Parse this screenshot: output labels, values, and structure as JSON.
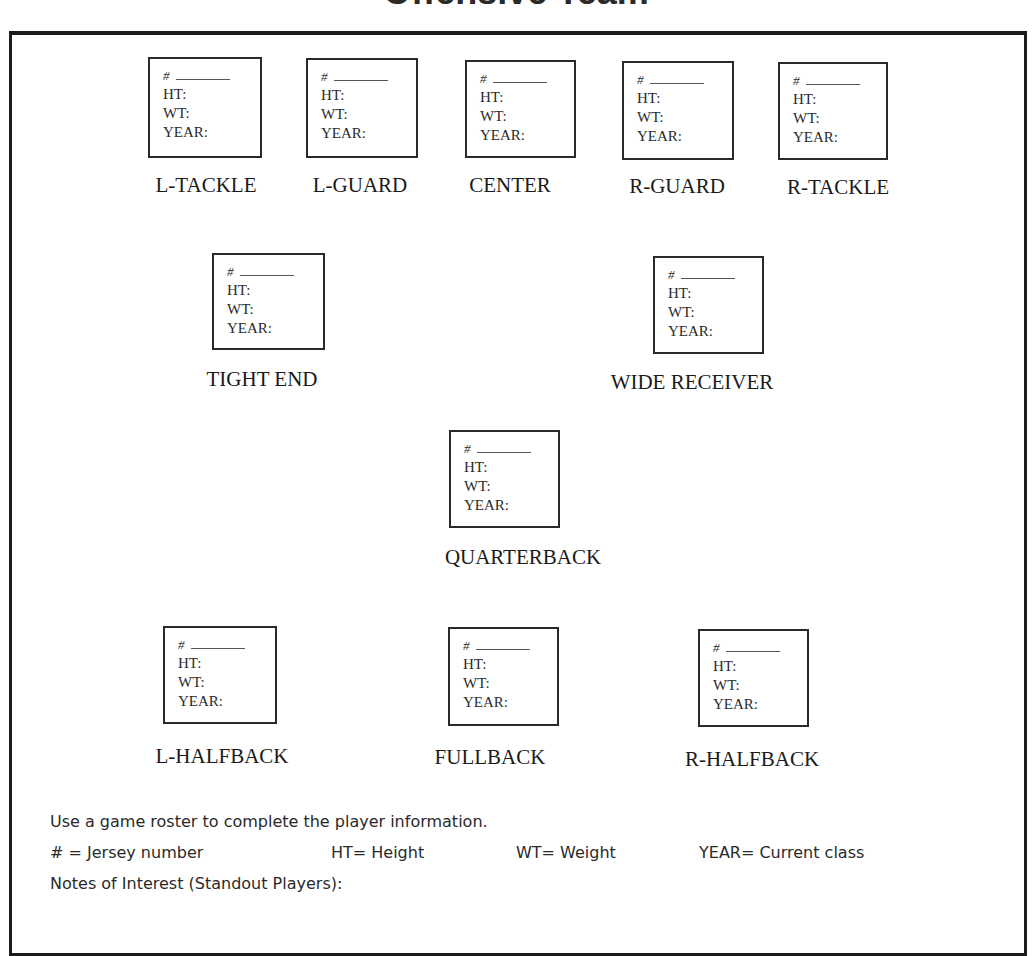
{
  "page": {
    "title": "Offensive Team"
  },
  "field_labels": {
    "jersey": "#",
    "height": "HT:",
    "weight": "WT:",
    "year": "YEAR:"
  },
  "positions": [
    {
      "id": "l-tackle",
      "label": "L-TACKLE",
      "box": {
        "x": 148,
        "y": 57,
        "w": 114,
        "h": 101
      },
      "label_pos": {
        "cx": 206,
        "y": 173
      }
    },
    {
      "id": "l-guard",
      "label": "L-GUARD",
      "box": {
        "x": 306,
        "y": 58,
        "w": 112,
        "h": 100
      },
      "label_pos": {
        "cx": 360,
        "y": 173
      }
    },
    {
      "id": "center",
      "label": "CENTER",
      "box": {
        "x": 465,
        "y": 60,
        "w": 111,
        "h": 98
      },
      "label_pos": {
        "cx": 510,
        "y": 173
      }
    },
    {
      "id": "r-guard",
      "label": "R-GUARD",
      "box": {
        "x": 622,
        "y": 61,
        "w": 112,
        "h": 99
      },
      "label_pos": {
        "cx": 677,
        "y": 174
      }
    },
    {
      "id": "r-tackle",
      "label": "R-TACKLE",
      "box": {
        "x": 778,
        "y": 62,
        "w": 110,
        "h": 98
      },
      "label_pos": {
        "cx": 838,
        "y": 175
      }
    },
    {
      "id": "tight-end",
      "label": "TIGHT END",
      "box": {
        "x": 212,
        "y": 253,
        "w": 113,
        "h": 97
      },
      "label_pos": {
        "cx": 262,
        "y": 367
      }
    },
    {
      "id": "wide-receiver",
      "label": "WIDE RECEIVER",
      "box": {
        "x": 653,
        "y": 256,
        "w": 111,
        "h": 98
      },
      "label_pos": {
        "cx": 692,
        "y": 370
      }
    },
    {
      "id": "quarterback",
      "label": "QUARTERBACK",
      "box": {
        "x": 449,
        "y": 430,
        "w": 111,
        "h": 98
      },
      "label_pos": {
        "cx": 523,
        "y": 545
      }
    },
    {
      "id": "l-halfback",
      "label": "L-HALFBACK",
      "box": {
        "x": 163,
        "y": 626,
        "w": 114,
        "h": 98
      },
      "label_pos": {
        "cx": 222,
        "y": 744
      }
    },
    {
      "id": "fullback",
      "label": "FULLBACK",
      "box": {
        "x": 448,
        "y": 627,
        "w": 111,
        "h": 99
      },
      "label_pos": {
        "cx": 490,
        "y": 745
      }
    },
    {
      "id": "r-halfback",
      "label": "R-HALFBACK",
      "box": {
        "x": 698,
        "y": 629,
        "w": 111,
        "h": 98
      },
      "label_pos": {
        "cx": 752,
        "y": 747
      }
    }
  ],
  "footer": {
    "instructions": "Use a game roster to complete the player information.",
    "legend": [
      {
        "text": "# = Jersey number",
        "x": 50
      },
      {
        "text": "HT= Height",
        "x": 331
      },
      {
        "text": "WT= Weight",
        "x": 516
      },
      {
        "text": "YEAR= Current class",
        "x": 699
      }
    ],
    "notes_label": "Notes of Interest (Standout Players):"
  }
}
